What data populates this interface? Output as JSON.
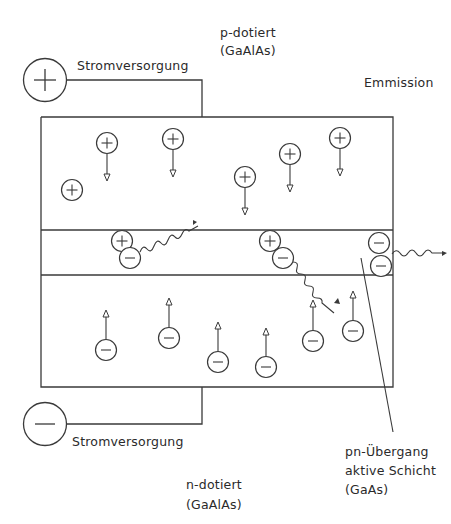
{
  "diagram": {
    "labels": {
      "power_top": "Stromversorgung",
      "power_bottom": "Stromversorgung",
      "p_doped_line1": "p-dotiert",
      "p_doped_line2": "(GaAlAs)",
      "emission": "Emmission",
      "n_doped_line1": "n-dotiert",
      "n_doped_line2": "(GaAlAs)",
      "junction_line1": "pn-Übergang",
      "junction_line2": "aktive Schicht",
      "junction_line3": "(GaAs)"
    },
    "terminals": {
      "positive": {
        "symbol": "+",
        "cx": 45,
        "cy": 80,
        "r": 22
      },
      "negative": {
        "symbol": "−",
        "cx": 45,
        "cy": 424,
        "r": 22
      }
    },
    "layers": {
      "outer_box": {
        "x": 41,
        "y": 117,
        "w": 127,
        "h": 0
      },
      "p_layer": {
        "name": "p-dotiert",
        "y_top": 117,
        "y_bottom": 230
      },
      "active_layer": {
        "name": "aktive Schicht",
        "y_top": 230,
        "y_bottom": 275
      },
      "n_layer": {
        "name": "n-dotiert",
        "y_top": 275,
        "y_bottom": 387
      }
    },
    "holes": [
      {
        "cx": 107,
        "cy": 143,
        "arrow_to": 180
      },
      {
        "cx": 173,
        "cy": 139,
        "arrow_to": 176
      },
      {
        "cx": 72,
        "cy": 190,
        "arrow_to": null
      },
      {
        "cx": 245,
        "cy": 177,
        "arrow_to": 214
      },
      {
        "cx": 290,
        "cy": 153,
        "arrow_to": 191
      },
      {
        "cx": 340,
        "cy": 138,
        "arrow_to": 175
      }
    ],
    "electrons": [
      {
        "cx": 106,
        "cy": 350,
        "arrow_to": 311
      },
      {
        "cx": 169,
        "cy": 338,
        "arrow_to": 298
      },
      {
        "cx": 218,
        "cy": 362,
        "arrow_to": 322
      },
      {
        "cx": 266,
        "cy": 367,
        "arrow_to": 328
      },
      {
        "cx": 313,
        "cy": 340,
        "arrow_to": 300
      },
      {
        "cx": 353,
        "cy": 331,
        "arrow_to": 292
      }
    ],
    "recombinations": [
      {
        "hole": {
          "cx": 122,
          "cy": 241
        },
        "electron": {
          "cx": 130,
          "cy": 258
        }
      },
      {
        "hole": {
          "cx": 270,
          "cy": 241
        },
        "electron": {
          "cx": 283,
          "cy": 258
        }
      },
      {
        "hole": null,
        "electron": {
          "cx": 379,
          "cy": 243
        },
        "electron2": {
          "cx": 381,
          "cy": 266
        }
      }
    ],
    "colors": {
      "stroke": "#3a3a3a",
      "text": "#2a2a2a",
      "background": "#ffffff"
    }
  }
}
